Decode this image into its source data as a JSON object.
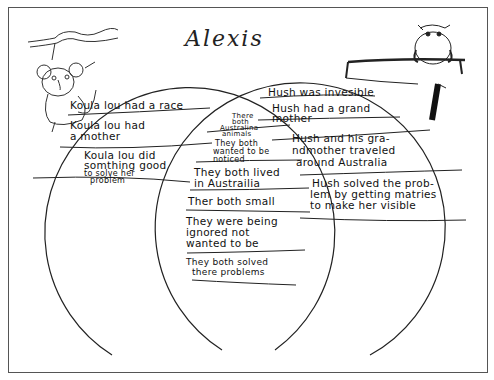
{
  "worksheet": {
    "title": "Alexis",
    "type": "Venn diagram",
    "illustrations": {
      "left": "koala-hanging-from-branch",
      "right": "possum-on-branch"
    },
    "left_circle": {
      "subject": "Koala Lou",
      "items": [
        {
          "text": "Koula lou had a race"
        },
        {
          "line1": "Koula lou had",
          "line2": "a mother"
        },
        {
          "line1": "Koula lou did",
          "line2": "somthing good",
          "line3": "to solve her",
          "line4": "problem"
        }
      ]
    },
    "overlap": {
      "items": [
        {
          "line1": "There",
          "line2": "both",
          "line3": "Australina",
          "line4": "animals"
        },
        {
          "line1": "They both",
          "line2": "wanted to be",
          "line3": "noticed"
        },
        {
          "line1": "They both lived",
          "line2": "in Austrailia"
        },
        {
          "text": "Ther both small"
        },
        {
          "line1": "They were being",
          "line2": "ignored not",
          "line3": "wanted to be"
        },
        {
          "line1": "They both solved",
          "line2": "there problems"
        }
      ]
    },
    "right_circle": {
      "subject": "Hush",
      "items": [
        {
          "text": "Hush was invesible"
        },
        {
          "line1": "Hush had a grand",
          "line2": "mother"
        },
        {
          "line1": "Hush and his gra-",
          "line2": "ndmother traveled",
          "line3": "around Australia"
        },
        {
          "line1": "Hush solved the prob-",
          "line2": "lem by getting matries",
          "line3": "to make her visible"
        }
      ]
    }
  }
}
